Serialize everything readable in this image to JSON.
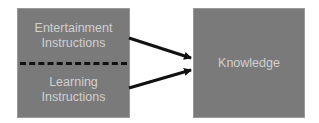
{
  "diagram": {
    "left_box": {
      "top_label_lines": [
        "Entertainment",
        "Instructions"
      ],
      "bottom_label_lines": [
        "Learning",
        "Instructions"
      ],
      "divider": "dashed"
    },
    "right_box": {
      "label": "Knowledge"
    },
    "edges": [
      {
        "from": "Entertainment Instructions",
        "to": "Knowledge"
      },
      {
        "from": "Learning Instructions",
        "to": "Knowledge"
      }
    ],
    "colors": {
      "box_fill": "#7a7a7a",
      "text": "#d0d0d0",
      "arrow": "#111111"
    }
  }
}
